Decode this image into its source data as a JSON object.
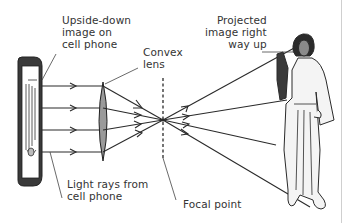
{
  "labels": {
    "phone_image": "Upside-down\nimage on\ncell phone",
    "lens": "Convex\nlens",
    "projected": "Projected\nimage right\nway up",
    "light_rays": "Light rays from\ncell phone",
    "focal_point": "Focal point"
  },
  "colors": {
    "line": "#2a2a2a",
    "lens_fill": "#9a9a9a",
    "phone_frame": "#3a3a3a",
    "face": "#8a8a8a",
    "hair": "#2b2b2b",
    "robe": "#f4f4f4"
  },
  "geometry": {
    "ray_y": [
      86,
      108,
      130,
      152
    ],
    "lens_x": 103,
    "focal_point": [
      163,
      120
    ]
  }
}
